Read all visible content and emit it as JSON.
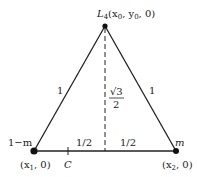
{
  "diagram": {
    "type": "equilateral-triangle-lagrange-point",
    "apex": {
      "label": "L",
      "subscript": "4",
      "coords": "(x",
      "x_sub": "0",
      "mid": ", y",
      "y_sub": "0",
      "tail": ", 0)"
    },
    "left_vertex": {
      "mass_label": "1−m",
      "coords_pre": "(x",
      "coords_sub": "1",
      "coords_post": ", 0)"
    },
    "right_vertex": {
      "mass_label": "m",
      "coords_pre": "(x",
      "coords_sub": "2",
      "coords_post": ", 0)"
    },
    "side_labels": {
      "left": "1",
      "right": "1"
    },
    "height_label": {
      "numerator": "√3",
      "denominator": "2"
    },
    "base_labels": {
      "left_half": "1/2",
      "right_half": "1/2"
    },
    "center_mark": {
      "label": "C"
    },
    "colors": {
      "line": "#222222",
      "background": "#ffffff"
    }
  }
}
